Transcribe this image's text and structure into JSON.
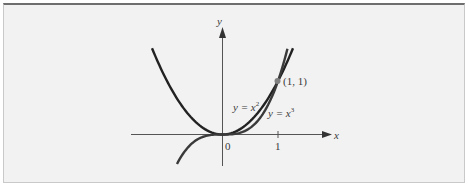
{
  "chart_data": {
    "type": "line",
    "title": "",
    "xlabel": "x",
    "ylabel": "y",
    "xlim": [
      -1.6,
      1.95
    ],
    "ylim": [
      -0.6,
      2.05
    ],
    "x_ticks": [
      {
        "value": 0,
        "label": "0"
      },
      {
        "value": 1,
        "label": "1"
      }
    ],
    "grid": false,
    "series": [
      {
        "name": "y = x^2",
        "label_base": "y = x",
        "label_exp": "2",
        "function": "x^2",
        "domain": [
          -1.27,
          1.27
        ]
      },
      {
        "name": "y = x^3",
        "label_base": "y = x",
        "label_exp": "3",
        "function": "x^3",
        "domain": [
          -0.82,
          1.17
        ]
      }
    ],
    "annotations": [
      {
        "text": "(1, 1)",
        "x": 1,
        "y": 1,
        "marker": "dot"
      }
    ],
    "colors": {
      "curve": "#222222",
      "axis": "#555555",
      "point": "#808080",
      "background": "#f2f2f2"
    }
  },
  "labels": {
    "x_axis": "x",
    "y_axis": "y",
    "origin": "0",
    "tick_one": "1",
    "point": "(1, 1)",
    "parabola_base": "y = x",
    "parabola_exp": "2",
    "cubic_base": "y = x",
    "cubic_exp": "3"
  }
}
